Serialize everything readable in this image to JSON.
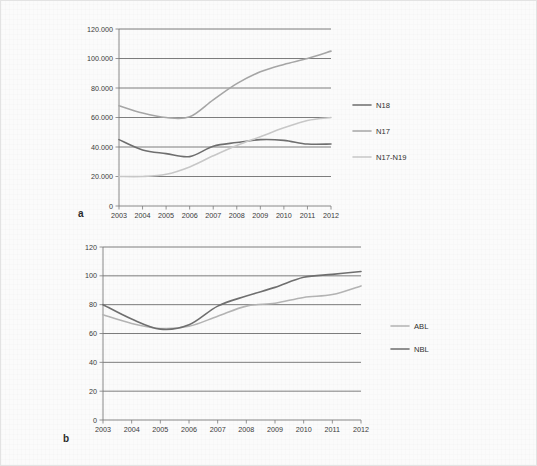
{
  "figure": {
    "background_color": "#fbfbfb",
    "border_color": "#e3e3e3",
    "grid_color": "#6e6e6e",
    "axis_color": "#7a7a7a"
  },
  "panels": [
    {
      "id": "a",
      "label": "a",
      "chart_data": {
        "type": "line",
        "title": "",
        "xlabel": "",
        "ylabel": "",
        "x": [
          2003,
          2004,
          2005,
          2006,
          2007,
          2008,
          2009,
          2010,
          2011,
          2012
        ],
        "categories": [
          "2003",
          "2004",
          "2005",
          "2006",
          "2007",
          "2008",
          "2009",
          "2010",
          "2011",
          "2012"
        ],
        "xlim": [
          2003,
          2012
        ],
        "ylim": [
          0,
          120000
        ],
        "ytick_labels": [
          "0",
          "20.000",
          "40.000",
          "60.000",
          "80.000",
          "100.000",
          "120.000"
        ],
        "ytick_values": [
          0,
          20000,
          40000,
          60000,
          80000,
          100000,
          120000
        ],
        "grid": true,
        "legend_position": "right",
        "series": [
          {
            "name": "N18",
            "color": "#6f6f6f",
            "width": 1.6,
            "values": [
              45000,
              38000,
              35500,
              33500,
              40500,
              43000,
              45000,
              44500,
              42000,
              42000
            ]
          },
          {
            "name": "N17",
            "color": "#a6a6a6",
            "width": 1.6,
            "values": [
              68000,
              63000,
              60000,
              60500,
              72000,
              83000,
              91000,
              96000,
              100000,
              105000
            ]
          },
          {
            "name": "N17-N19",
            "color": "#c8c8c8",
            "width": 1.6,
            "values": [
              20000,
              20000,
              21500,
              26500,
              34000,
              41000,
              47000,
              53000,
              58000,
              60000
            ]
          }
        ]
      }
    },
    {
      "id": "b",
      "label": "b",
      "chart_data": {
        "type": "line",
        "title": "",
        "xlabel": "",
        "ylabel": "",
        "x": [
          2003,
          2004,
          2005,
          2006,
          2007,
          2008,
          2009,
          2010,
          2011,
          2012
        ],
        "categories": [
          "2003",
          "2004",
          "2005",
          "2006",
          "2007",
          "2008",
          "2009",
          "2010",
          "2011",
          "2012"
        ],
        "xlim": [
          2003,
          2012
        ],
        "ylim": [
          0,
          120
        ],
        "ytick_labels": [
          "0",
          "20",
          "40",
          "60",
          "80",
          "100",
          "120"
        ],
        "ytick_values": [
          0,
          20,
          40,
          60,
          80,
          100,
          120
        ],
        "grid": true,
        "legend_position": "right",
        "series": [
          {
            "name": "ABL",
            "color": "#b4b4b4",
            "width": 1.6,
            "values": [
              73,
              67,
              63.5,
              65,
              72,
              79,
              81,
              85,
              87,
              93
            ]
          },
          {
            "name": "NBL",
            "color": "#6f6f6f",
            "width": 1.6,
            "values": [
              80,
              70,
              63,
              66,
              79,
              86,
              92,
              99,
              101,
              103
            ]
          }
        ]
      }
    }
  ]
}
